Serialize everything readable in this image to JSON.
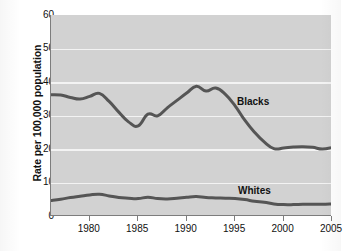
{
  "chart_data": {
    "type": "line",
    "title": "",
    "xlabel": "",
    "ylabel": "Rate per 100,000 population",
    "xlim": [
      1976,
      2005
    ],
    "ylim": [
      0,
      60
    ],
    "xticks": [
      1980,
      1985,
      1990,
      1995,
      2000,
      2005
    ],
    "xtick_labels": [
      "1980",
      "1985",
      "1990",
      "1995",
      "2000",
      "2005"
    ],
    "yticks": [
      0,
      10,
      20,
      30,
      40,
      50,
      60
    ],
    "ytick_labels": [
      "0",
      "10",
      "20",
      "30",
      "40",
      "50",
      "60"
    ],
    "grid": true,
    "grid_axis": "y",
    "legend": "inline-labels",
    "plot_background": "#d2d2d2",
    "line_color": "#555555",
    "x": [
      1976,
      1977,
      1978,
      1979,
      1980,
      1981,
      1982,
      1983,
      1984,
      1985,
      1986,
      1987,
      1988,
      1989,
      1990,
      1991,
      1992,
      1993,
      1994,
      1995,
      1996,
      1997,
      1998,
      1999,
      2000,
      2001,
      2002,
      2003,
      2004,
      2005
    ],
    "series": [
      {
        "name": "Blacks",
        "label": "Blacks",
        "values": [
          36.2,
          36.1,
          35.4,
          34.9,
          35.7,
          36.6,
          34.2,
          31.0,
          28.1,
          26.9,
          30.4,
          29.9,
          32.3,
          34.5,
          36.7,
          38.7,
          37.3,
          38.2,
          36.3,
          32.9,
          28.6,
          25.0,
          22.1,
          20.1,
          20.3,
          20.6,
          20.7,
          20.5,
          20.0,
          20.4
        ]
      },
      {
        "name": "Whites",
        "label": "Whites",
        "values": [
          4.6,
          5.0,
          5.5,
          5.9,
          6.3,
          6.5,
          6.0,
          5.5,
          5.3,
          5.2,
          5.6,
          5.2,
          5.1,
          5.3,
          5.6,
          5.8,
          5.5,
          5.4,
          5.3,
          5.2,
          4.9,
          4.4,
          4.1,
          3.6,
          3.4,
          3.4,
          3.5,
          3.5,
          3.5,
          3.6
        ]
      }
    ]
  },
  "labels": {
    "y_axis_title": "Rate per 100,000 population",
    "series_blacks": "Blacks",
    "series_whites": "Whites"
  }
}
